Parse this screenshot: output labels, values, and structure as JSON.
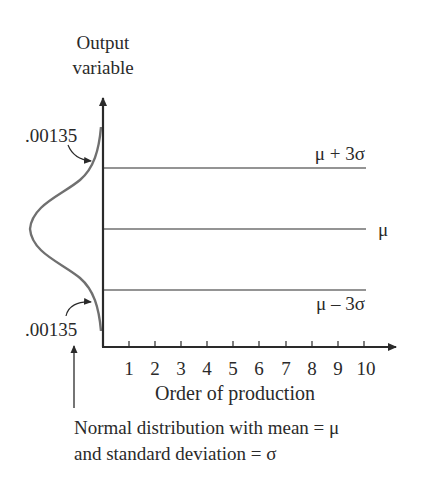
{
  "y_axis": {
    "title_line1": "Output",
    "title_line2": "variable"
  },
  "x_axis": {
    "title": "Order of production",
    "ticks": [
      "1",
      "2",
      "3",
      "4",
      "5",
      "6",
      "7",
      "8",
      "9",
      "10"
    ]
  },
  "limits": {
    "upper": "μ + 3σ",
    "center": "μ",
    "lower": "μ – 3σ"
  },
  "tail_labels": {
    "upper": ".00135",
    "lower": ".00135"
  },
  "caption": {
    "line1": "Normal distribution with mean = μ",
    "line2": "and standard deviation = σ"
  },
  "colors": {
    "ink": "#2a2a2a",
    "curve": "#707070",
    "background": "#ffffff"
  }
}
